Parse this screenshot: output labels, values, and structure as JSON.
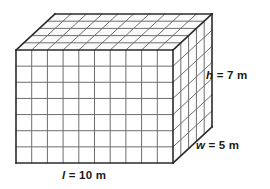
{
  "figure": {
    "name": "rectangular-prism-unit-cubes",
    "background_color": "#ffffff",
    "grid_line_color": "#6e6e6e",
    "outline_color": "#2b2b2b",
    "face_fill_color": "#ffffff",
    "top_face_fill_color": "#fbfbfb",
    "right_face_fill_color": "#fdfdfd"
  },
  "dimensions": {
    "length": {
      "symbol": "l",
      "value": 10,
      "unit": "m",
      "text": "= 10 m",
      "full": "l = 10 m"
    },
    "width": {
      "symbol": "w",
      "value": 5,
      "unit": "m",
      "text": "= 5 m",
      "full": "w = 5 m"
    },
    "height": {
      "symbol": "h",
      "value": 7,
      "unit": "m",
      "text": "= 7 m",
      "full": "h = 7 m"
    }
  },
  "geometry": {
    "front_face": {
      "x": 16,
      "y": 50,
      "width": 157,
      "height": 113,
      "columns": 10,
      "rows": 7
    },
    "depth_offset": {
      "dx": 39,
      "dy": -36
    },
    "depth_divisions": 5
  },
  "chart_data": {
    "type": "diagram",
    "title": "",
    "shape": "rectangular prism",
    "unit_cubes_along_length": 10,
    "unit_cubes_along_width": 5,
    "unit_cubes_along_height": 7,
    "labels": [
      "l = 10 m",
      "w = 5 m",
      "h = 7 m"
    ]
  }
}
